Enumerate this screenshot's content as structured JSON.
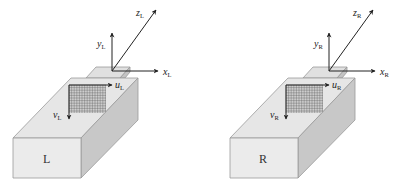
{
  "diagram": {
    "type": "stereo-camera-coordinate-systems",
    "cameras": [
      {
        "id": "left",
        "name": "L",
        "offset_x": 0,
        "axes": {
          "x": {
            "symbol": "x",
            "subscript": "L"
          },
          "y": {
            "symbol": "y",
            "subscript": "L"
          },
          "z": {
            "symbol": "z",
            "subscript": "L"
          }
        },
        "image_axes": {
          "u": {
            "symbol": "u",
            "subscript": "L"
          },
          "v": {
            "symbol": "v",
            "subscript": "L"
          }
        }
      },
      {
        "id": "right",
        "name": "R",
        "offset_x": 217,
        "axes": {
          "x": {
            "symbol": "x",
            "subscript": "R"
          },
          "y": {
            "symbol": "y",
            "subscript": "R"
          },
          "z": {
            "symbol": "z",
            "subscript": "R"
          }
        },
        "image_axes": {
          "u": {
            "symbol": "u",
            "subscript": "R"
          },
          "v": {
            "symbol": "v",
            "subscript": "R"
          }
        }
      }
    ],
    "colors": {
      "front_face": "#ebebeb",
      "top_face": "#e6e6e6",
      "side_face": "#c8c8c8",
      "edge": "#9a9a9a",
      "axis": "#222222",
      "grid": "#555555"
    }
  }
}
